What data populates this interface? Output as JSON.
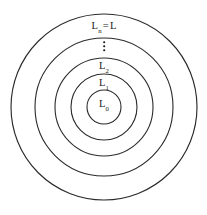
{
  "figure": {
    "background_color": "#ffffff",
    "stroke_color": "#2b2b2b",
    "text_color": "#1a1a1a",
    "center": {
      "x": 104,
      "y": 107
    },
    "rings": [
      {
        "id": "ring-0",
        "name": "L_0",
        "radius": 17
      },
      {
        "id": "ring-1",
        "name": "L_1",
        "radius": 33
      },
      {
        "id": "ring-2",
        "name": "L_2",
        "radius": 49
      },
      {
        "id": "ring-3",
        "name": "L_intermediate",
        "radius": 69
      },
      {
        "id": "ring-4",
        "name": "L_n",
        "radius": 93
      }
    ],
    "labels": [
      {
        "id": "label-l0",
        "base": "L",
        "subscript": "0",
        "equals": "",
        "equals_rhs": "",
        "x": 104,
        "y": 104
      },
      {
        "id": "label-l1",
        "base": "L",
        "subscript": "1",
        "equals": "",
        "equals_rhs": "",
        "x": 104,
        "y": 83
      },
      {
        "id": "label-l2",
        "base": "L",
        "subscript": "2",
        "equals": "",
        "equals_rhs": "",
        "x": 104,
        "y": 66
      },
      {
        "id": "label-dots",
        "base": "⋮",
        "subscript": "",
        "equals": "",
        "equals_rhs": "",
        "x": 104,
        "y": 46
      },
      {
        "id": "label-ln",
        "base": "L",
        "subscript": "n",
        "equals": "=",
        "equals_rhs": "L",
        "x": 104,
        "y": 26
      }
    ]
  }
}
